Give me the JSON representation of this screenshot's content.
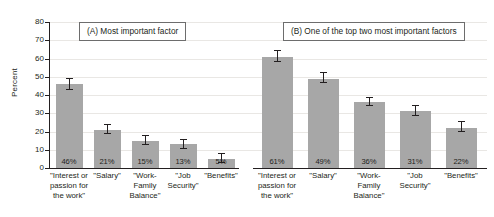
{
  "chart_data": {
    "type": "bar",
    "title": "",
    "xlabel": "",
    "ylabel": "Percent",
    "ylim": [
      0,
      80
    ],
    "ytick_step": 10,
    "yticks": [
      80,
      70,
      60,
      50,
      40,
      30,
      20,
      10,
      0
    ],
    "ytick_labels": [
      "80",
      "70",
      "60",
      "50",
      "40",
      "30",
      "20",
      "10",
      "0"
    ],
    "grid": "horizontal",
    "legend": "none",
    "bar_color": "#a7a7a7",
    "categories": [
      "\"Interest or passion for the work\"",
      "\"Salary\"",
      "\"Work-Family Balance\"",
      "\"Job Security\"",
      "\"Benefits\""
    ],
    "panels": [
      {
        "id": "A",
        "title": "(A) Most important factor",
        "values": [
          46,
          21,
          15,
          13,
          5
        ],
        "value_labels": [
          "46%",
          "21%",
          "15%",
          "13%",
          "5%"
        ],
        "error_low": [
          43,
          18.5,
          12.5,
          10.5,
          3
        ],
        "error_high": [
          49,
          23.5,
          17.5,
          15.5,
          7.5
        ]
      },
      {
        "id": "B",
        "title": "(B) One of the top two most important factors",
        "values": [
          61,
          49,
          36,
          31,
          22
        ],
        "value_labels": [
          "61%",
          "49%",
          "36%",
          "31%",
          "22%"
        ],
        "error_low": [
          58,
          46.5,
          34,
          28.5,
          19.5
        ],
        "error_high": [
          64,
          52,
          38.5,
          34,
          25
        ]
      }
    ],
    "category_label_lines": [
      [
        "\"Interest or",
        "passion for",
        "the work\""
      ],
      [
        "\"Salary\""
      ],
      [
        "\"Work-",
        "Family",
        "Balance\""
      ],
      [
        "\"Job",
        "Security\""
      ],
      [
        "\"Benefits\""
      ]
    ]
  }
}
